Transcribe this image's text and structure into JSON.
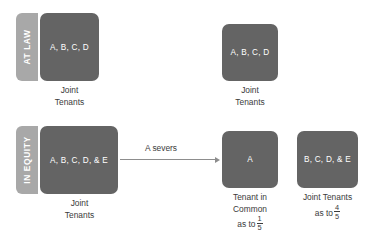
{
  "diagram": {
    "rows": [
      {
        "tab_label": "AT LAW",
        "boxes": [
          {
            "members": "A, B, C, D",
            "caption_line1": "Joint",
            "caption_line2": "Tenants"
          },
          {
            "members": "A, B, C, D",
            "caption_line1": "Joint",
            "caption_line2": "Tenants"
          }
        ]
      },
      {
        "tab_label": "IN EQUITY",
        "boxes": [
          {
            "members": "A, B, C, D, & E",
            "caption_line1": "Joint",
            "caption_line2": "Tenants"
          },
          {
            "members": "A",
            "caption_line1": "Tenant in",
            "caption_line2": "Common",
            "caption_line3": "as to",
            "fraction_numerator": "1",
            "fraction_denominator": "5"
          },
          {
            "members": "B, C, D, & E",
            "caption_line1": "Joint Tenants",
            "caption_line2": "as to",
            "fraction_numerator": "4",
            "fraction_denominator": "5"
          }
        ]
      }
    ],
    "arrow": {
      "label": "A severs"
    },
    "colors": {
      "box_fill": "#646464",
      "tab_fill": "#a8a8a8",
      "box_text": "#ffffff",
      "caption_text": "#3b3b3b",
      "arrow": "#8d8d8d",
      "background": "#ffffff"
    }
  }
}
